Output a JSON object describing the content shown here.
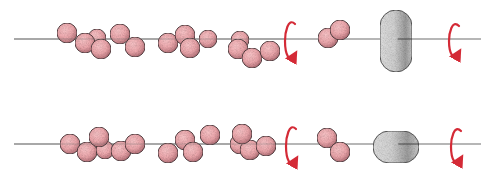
{
  "figure": {
    "colors": {
      "background": "#ffffff",
      "axis": "#6e6e6e",
      "sphere_fill": "#eeaaae",
      "sphere_shade": "#b8757c",
      "sphere_stroke": "#4a3236",
      "ellipsoid_fill": "#d4d4d4",
      "ellipsoid_shade": "#8a8a8a",
      "ellipsoid_stroke": "#555555",
      "arrow": "#d42a36"
    },
    "rows": [
      {
        "name": "top-row",
        "axis": {
          "y": 39,
          "x1": 14,
          "x2": 481
        },
        "bead_model": [
          [
            97,
            38,
            9
          ],
          [
            67,
            33,
            10
          ],
          [
            85,
            43,
            10
          ],
          [
            101,
            49,
            10
          ],
          [
            120,
            34,
            10
          ],
          [
            135,
            47,
            10
          ],
          [
            168,
            43,
            10
          ],
          [
            208,
            39,
            9
          ],
          [
            185,
            35,
            10
          ],
          [
            190,
            48,
            10
          ],
          [
            240,
            40,
            9
          ],
          [
            238,
            49,
            10
          ],
          [
            252,
            58,
            10
          ],
          [
            270,
            51,
            10
          ]
        ],
        "rotation_arrow_1": {
          "x": 291,
          "y1": 20,
          "y2": 62
        },
        "dimer": [
          [
            328,
            38,
            10
          ],
          [
            340,
            30,
            10
          ]
        ],
        "ellipsoid": {
          "x": 380,
          "y": 10,
          "w": 32,
          "h": 62,
          "orientation": "vertical"
        },
        "rotation_arrow_2": {
          "x": 455,
          "y1": 22,
          "y2": 60
        }
      },
      {
        "name": "bottom-row",
        "axis": {
          "y": 144,
          "x1": 14,
          "x2": 481
        },
        "bead_model": [
          [
            70,
            144,
            10
          ],
          [
            87,
            152,
            10
          ],
          [
            105,
            150,
            9
          ],
          [
            99,
            137,
            10
          ],
          [
            121,
            151,
            10
          ],
          [
            135,
            144,
            10
          ],
          [
            168,
            153,
            10
          ],
          [
            185,
            140,
            10
          ],
          [
            193,
            152,
            10
          ],
          [
            210,
            135,
            10
          ],
          [
            240,
            144,
            10
          ],
          [
            250,
            150,
            10
          ],
          [
            266,
            146,
            10
          ],
          [
            242,
            134,
            10
          ]
        ],
        "rotation_arrow_1": {
          "x": 292,
          "y1": 125,
          "y2": 167
        },
        "dimer": [
          [
            327,
            138,
            10
          ],
          [
            340,
            152,
            10
          ]
        ],
        "ellipsoid": {
          "x": 373,
          "y": 131,
          "w": 46,
          "h": 32,
          "orientation": "horizontal"
        },
        "rotation_arrow_2": {
          "x": 457,
          "y1": 127,
          "y2": 166
        }
      }
    ]
  }
}
